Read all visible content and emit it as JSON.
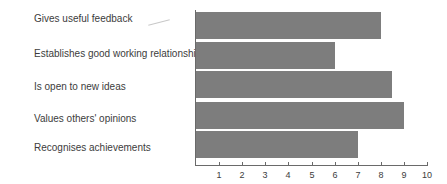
{
  "chart_data": {
    "type": "bar",
    "orientation": "horizontal",
    "title": "",
    "xlabel": "",
    "ylabel": "",
    "categories": [
      "Gives useful feedback",
      "Establishes good working relationships",
      "Is open to new ideas",
      "Values others' opinions",
      "Recognises achievements"
    ],
    "values": [
      8,
      6,
      8.5,
      9,
      7
    ],
    "xlim": [
      0,
      10
    ],
    "x_ticks": [
      "1",
      "2",
      "3",
      "4",
      "5",
      "6",
      "7",
      "8",
      "9",
      "10"
    ],
    "grid": false,
    "legend": "none",
    "bar_color": "#7d7d7d"
  }
}
